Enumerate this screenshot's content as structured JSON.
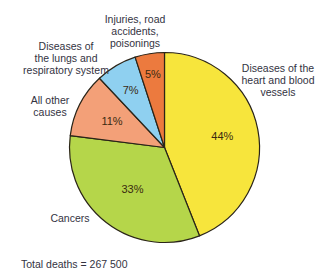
{
  "chart_data": {
    "type": "pie",
    "title": "",
    "categories": [
      "Diseases of the heart and blood vessels",
      "Cancers",
      "All other causes",
      "Diseases of the lungs and respiratory system",
      "Injuries, road accidents, poisonings"
    ],
    "values": [
      44,
      33,
      11,
      7,
      5
    ],
    "value_labels": [
      "44%",
      "33%",
      "11%",
      "7%",
      "5%"
    ],
    "colors": [
      "#f7e53c",
      "#b5d64a",
      "#f3a078",
      "#8fd0f0",
      "#ec7a3e"
    ],
    "start_angle": "12 o'clock, clockwise",
    "annotation": "Total deaths = 267 500"
  },
  "labels": {
    "heart": "Diseases of the\nheart and blood\nvessels",
    "cancers": "Cancers",
    "other": "All other\ncauses",
    "lungs": "Diseases of\nthe lungs and\nrespiratory system",
    "injuries": "Injuries, road\naccidents,\npoisonings"
  },
  "footer": {
    "total": "Total deaths = 267 500"
  },
  "style": {
    "outline": "#2a2418"
  }
}
